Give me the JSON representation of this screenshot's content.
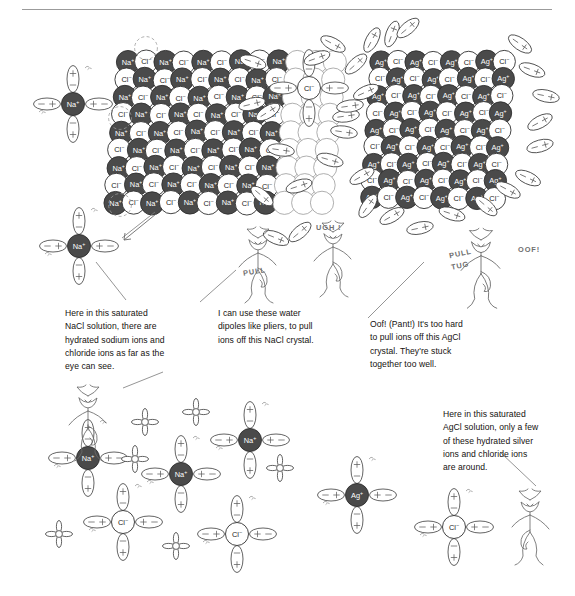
{
  "figure": {
    "title_rule": true,
    "colors": {
      "cation_fill": "#4a4a4a",
      "anion_fill": "#ffffff",
      "outline": "#2f2f2f",
      "dipole_stroke": "#3b3b3b",
      "caption_text": "#15120f",
      "hand_text": "#6f6f6f",
      "rule": "#9b9b9b"
    },
    "ion_labels": {
      "sodium": "Na",
      "sodium_charge": "+",
      "chloride": "Cl",
      "chloride_charge": "−",
      "silver": "Ag",
      "silver_charge": "+"
    },
    "dipole_signs": {
      "positive": "+",
      "negative": "−"
    }
  },
  "captions": [
    {
      "name": "caption-nacl-solution",
      "lines": [
        "Here in this saturated",
        "NaCl solution, there are",
        "hydrated sodium ions and",
        "chloride ions as far as the",
        "eye can see."
      ]
    },
    {
      "name": "caption-water-pliers",
      "lines": [
        "I can use these water",
        "dipoles like pliers, to pull",
        "ions off this NaCl crystal."
      ]
    },
    {
      "name": "caption-agcl-too-hard",
      "lines": [
        "Oof! (Pant!) It's too hard",
        "to pull ions off this AgCl",
        "crystal. They're stuck",
        "together too well."
      ]
    },
    {
      "name": "caption-agcl-solution",
      "lines": [
        "Here in this saturated",
        "AgCl solution, only a few",
        "of these hydrated silver",
        "ions and chloride ions",
        "are around."
      ]
    }
  ],
  "hand_annotations": [
    {
      "name": "annotation-pull",
      "text": "PULL"
    },
    {
      "name": "annotation-ugh",
      "text": "UGH !"
    },
    {
      "name": "annotation-pull-tug-1",
      "text": "PULL"
    },
    {
      "name": "annotation-pull-tug-2",
      "text": "TUG"
    },
    {
      "name": "annotation-oof",
      "text": "OOF!"
    }
  ],
  "crystals": [
    {
      "name": "nacl-crystal",
      "cation": "Na",
      "anion": "Cl",
      "label": "NaCl crystal lattice"
    },
    {
      "name": "agcl-crystal",
      "cation": "Ag",
      "anion": "Cl",
      "label": "AgCl crystal lattice"
    }
  ],
  "hydrated_ions": [
    {
      "name": "hydrated-sodium-ion",
      "ion": "Na",
      "charge": "+",
      "waters": 4
    },
    {
      "name": "hydrated-chloride-ion",
      "ion": "Cl",
      "charge": "−",
      "waters": 4
    },
    {
      "name": "hydrated-silver-ion",
      "ion": "Ag",
      "charge": "+",
      "waters": 4
    }
  ],
  "characters": [
    {
      "name": "devil-puller-nacl",
      "label": "cartoon devil pulling ion off NaCl crystal"
    },
    {
      "name": "devil-straining-agcl",
      "label": "cartoon devil straining at AgCl crystal"
    },
    {
      "name": "devil-reclining-nacl-solution",
      "label": "cartoon devil reclining among hydrated ions"
    },
    {
      "name": "devil-pointing-agcl-solution",
      "label": "cartoon devil pointing at lone hydrated ions"
    }
  ]
}
